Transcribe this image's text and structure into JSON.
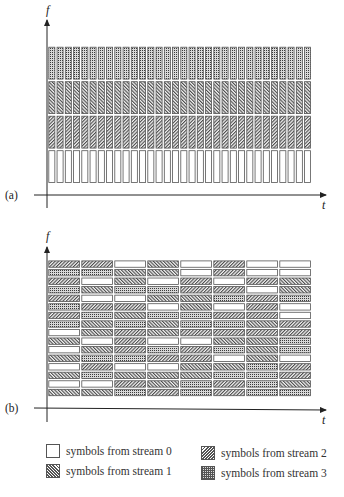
{
  "figure": {
    "panel_a": {
      "label": "(a)",
      "y_axis_label": "f",
      "x_axis_label": "t",
      "columns": 32,
      "rows_top_to_bottom": [
        3,
        2,
        1,
        0
      ]
    },
    "panel_b": {
      "label": "(b)",
      "y_axis_label": "f",
      "x_axis_label": "t",
      "columns": 8,
      "grid_top_to_bottom": [
        [
          1,
          1,
          0,
          2,
          0,
          1,
          0,
          0
        ],
        [
          3,
          3,
          2,
          2,
          0,
          1,
          0,
          0
        ],
        [
          1,
          0,
          2,
          0,
          1,
          0,
          1,
          2
        ],
        [
          3,
          2,
          3,
          3,
          1,
          1,
          0,
          2
        ],
        [
          1,
          0,
          0,
          2,
          2,
          3,
          1,
          3
        ],
        [
          3,
          1,
          1,
          0,
          2,
          0,
          1,
          0
        ],
        [
          1,
          3,
          2,
          3,
          3,
          1,
          1,
          0
        ],
        [
          3,
          2,
          3,
          2,
          3,
          3,
          2,
          1
        ],
        [
          0,
          2,
          1,
          2,
          1,
          1,
          1,
          1
        ],
        [
          2,
          0,
          1,
          0,
          0,
          2,
          2,
          3
        ],
        [
          0,
          2,
          1,
          3,
          1,
          3,
          2,
          3
        ],
        [
          2,
          3,
          3,
          1,
          1,
          0,
          2,
          0
        ],
        [
          0,
          1,
          0,
          0,
          2,
          2,
          3,
          1
        ],
        [
          2,
          3,
          2,
          2,
          2,
          3,
          3,
          1
        ],
        [
          0,
          0,
          1,
          2,
          3,
          1,
          3,
          2
        ],
        [
          2,
          2,
          3,
          1,
          3,
          1,
          3,
          3
        ]
      ]
    },
    "legend": [
      {
        "stream": 0,
        "label": "symbols from stream 0",
        "pattern": "blank"
      },
      {
        "stream": 1,
        "label": "symbols from stream 1",
        "pattern": "backslash-hatch"
      },
      {
        "stream": 2,
        "label": "symbols from stream 2",
        "pattern": "slash-hatch"
      },
      {
        "stream": 3,
        "label": "symbols from stream 3",
        "pattern": "grid"
      }
    ]
  }
}
